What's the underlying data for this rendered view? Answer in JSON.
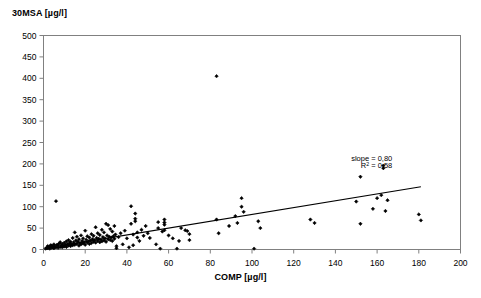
{
  "chart_data": {
    "type": "scatter",
    "title": "",
    "ylabel": "30MSA [µg/l]",
    "xlabel": "COMP [µg/l]",
    "xlim": [
      0,
      200
    ],
    "ylim": [
      0,
      500
    ],
    "xticks": [
      0,
      20,
      40,
      60,
      80,
      100,
      120,
      140,
      160,
      180,
      200
    ],
    "yticks": [
      0,
      50,
      100,
      150,
      200,
      250,
      300,
      350,
      400,
      450,
      500
    ],
    "xtick_labels": [
      "0",
      "20",
      "40",
      "60",
      "80",
      "100",
      "120",
      "140",
      "160",
      "180",
      "200"
    ],
    "ytick_labels": [
      "0",
      "50",
      "100",
      "150",
      "200",
      "250",
      "300",
      "350",
      "400",
      "450",
      "500"
    ],
    "grid": false,
    "legend": "none",
    "marker": "diamond",
    "marker_color": "#000000",
    "annotations": [
      {
        "text": "slope = 0,80",
        "x": 150,
        "y": 207
      },
      {
        "text": "R² = 0,58",
        "x": 150,
        "y": 190
      }
    ],
    "annotation_lines": [
      "slope = 0,80",
      "R² = 0,58"
    ],
    "fit_line": {
      "slope": 0.8,
      "intercept": 2.0,
      "r_squared": 0.58,
      "x_start": 8,
      "x_end": 181,
      "color": "#000000"
    },
    "series": [
      {
        "name": "samples",
        "points": [
          [
            1,
            2
          ],
          [
            1.5,
            4
          ],
          [
            2,
            3
          ],
          [
            2,
            8
          ],
          [
            2.5,
            5
          ],
          [
            3,
            2
          ],
          [
            3,
            7
          ],
          [
            3.5,
            10
          ],
          [
            4,
            4
          ],
          [
            4,
            9
          ],
          [
            4.5,
            6
          ],
          [
            5,
            3
          ],
          [
            5,
            12
          ],
          [
            5.5,
            8
          ],
          [
            6,
            5
          ],
          [
            6,
            113
          ],
          [
            6.5,
            11
          ],
          [
            7,
            4
          ],
          [
            7,
            9
          ],
          [
            7.5,
            14
          ],
          [
            8,
            6
          ],
          [
            8,
            17
          ],
          [
            8.5,
            10
          ],
          [
            9,
            5
          ],
          [
            9,
            13
          ],
          [
            9.5,
            8
          ],
          [
            10,
            7
          ],
          [
            10,
            16
          ],
          [
            10.5,
            11
          ],
          [
            11,
            6
          ],
          [
            11,
            19
          ],
          [
            11.5,
            13
          ],
          [
            12,
            9
          ],
          [
            12,
            22
          ],
          [
            12.5,
            15
          ],
          [
            13,
            8
          ],
          [
            13,
            18
          ],
          [
            13.5,
            12
          ],
          [
            14,
            10
          ],
          [
            14,
            27
          ],
          [
            14.5,
            17
          ],
          [
            15,
            11
          ],
          [
            15,
            40
          ],
          [
            15.5,
            21
          ],
          [
            16,
            13
          ],
          [
            16,
            30
          ],
          [
            16.5,
            18
          ],
          [
            17,
            9
          ],
          [
            17,
            24
          ],
          [
            17.5,
            15
          ],
          [
            18,
            12
          ],
          [
            18,
            33
          ],
          [
            18.5,
            20
          ],
          [
            19,
            14
          ],
          [
            19,
            26
          ],
          [
            19.5,
            17
          ],
          [
            20,
            11
          ],
          [
            20,
            44
          ],
          [
            20.5,
            23
          ],
          [
            21,
            16
          ],
          [
            21,
            31
          ],
          [
            21.5,
            19
          ],
          [
            22,
            13
          ],
          [
            22,
            28
          ],
          [
            22.5,
            21
          ],
          [
            23,
            15
          ],
          [
            23,
            36
          ],
          [
            23.5,
            24
          ],
          [
            24,
            18
          ],
          [
            24,
            32
          ],
          [
            24.5,
            22
          ],
          [
            25,
            16
          ],
          [
            25,
            52
          ],
          [
            25.5,
            27
          ],
          [
            26,
            20
          ],
          [
            26,
            38
          ],
          [
            26.5,
            25
          ],
          [
            27,
            17
          ],
          [
            27,
            34
          ],
          [
            27.5,
            23
          ],
          [
            28,
            19
          ],
          [
            28,
            46
          ],
          [
            28.5,
            29
          ],
          [
            29,
            21
          ],
          [
            29,
            40
          ],
          [
            29.5,
            26
          ],
          [
            30,
            18
          ],
          [
            30,
            60
          ],
          [
            30.5,
            33
          ],
          [
            31,
            24
          ],
          [
            31,
            57
          ],
          [
            31.5,
            30
          ],
          [
            32,
            22
          ],
          [
            32,
            48
          ],
          [
            32.5,
            28
          ],
          [
            33,
            20
          ],
          [
            33,
            42
          ],
          [
            33.5,
            31
          ],
          [
            34,
            25
          ],
          [
            34,
            55
          ],
          [
            34.5,
            35
          ],
          [
            35,
            8
          ],
          [
            35,
            3
          ],
          [
            36,
            29
          ],
          [
            37,
            38
          ],
          [
            38,
            12
          ],
          [
            39,
            44
          ],
          [
            40,
            26
          ],
          [
            41,
            5
          ],
          [
            42,
            101
          ],
          [
            42,
            60
          ],
          [
            43,
            10
          ],
          [
            43,
            35
          ],
          [
            44,
            84
          ],
          [
            44,
            72
          ],
          [
            44,
            66
          ],
          [
            45,
            40
          ],
          [
            45,
            28
          ],
          [
            46,
            20
          ],
          [
            47,
            46
          ],
          [
            48,
            32
          ],
          [
            49,
            55
          ],
          [
            50,
            38
          ],
          [
            51,
            27
          ],
          [
            54,
            12
          ],
          [
            55,
            50
          ],
          [
            55,
            64
          ],
          [
            56,
            2
          ],
          [
            57,
            42
          ],
          [
            58,
            70
          ],
          [
            58,
            63
          ],
          [
            58,
            58
          ],
          [
            58,
            45
          ],
          [
            60,
            33
          ],
          [
            62,
            26
          ],
          [
            64,
            2
          ],
          [
            65,
            20
          ],
          [
            66,
            50
          ],
          [
            68,
            45
          ],
          [
            69,
            43
          ],
          [
            70,
            36
          ],
          [
            70,
            22
          ],
          [
            83,
            405
          ],
          [
            83,
            70
          ],
          [
            84,
            38
          ],
          [
            89,
            55
          ],
          [
            92,
            78
          ],
          [
            93,
            62
          ],
          [
            95,
            120
          ],
          [
            95,
            100
          ],
          [
            96,
            88
          ],
          [
            101,
            2
          ],
          [
            103,
            66
          ],
          [
            104,
            50
          ],
          [
            128,
            70
          ],
          [
            130,
            62
          ],
          [
            150,
            112
          ],
          [
            152,
            170
          ],
          [
            152,
            60
          ],
          [
            158,
            95
          ],
          [
            160,
            120
          ],
          [
            162,
            127
          ],
          [
            163,
            196
          ],
          [
            163,
            190
          ],
          [
            164,
            90
          ],
          [
            165,
            115
          ],
          [
            180,
            82
          ],
          [
            181,
            68
          ]
        ]
      }
    ]
  },
  "chart_meta": {
    "y_axis_title": "30MSA [µg/l]",
    "x_axis_title": "COMP [µg/l]",
    "slope_label": "slope = 0,80",
    "r2_base": "R",
    "r2_sup": "2",
    "r2_value": " = 0,58"
  }
}
